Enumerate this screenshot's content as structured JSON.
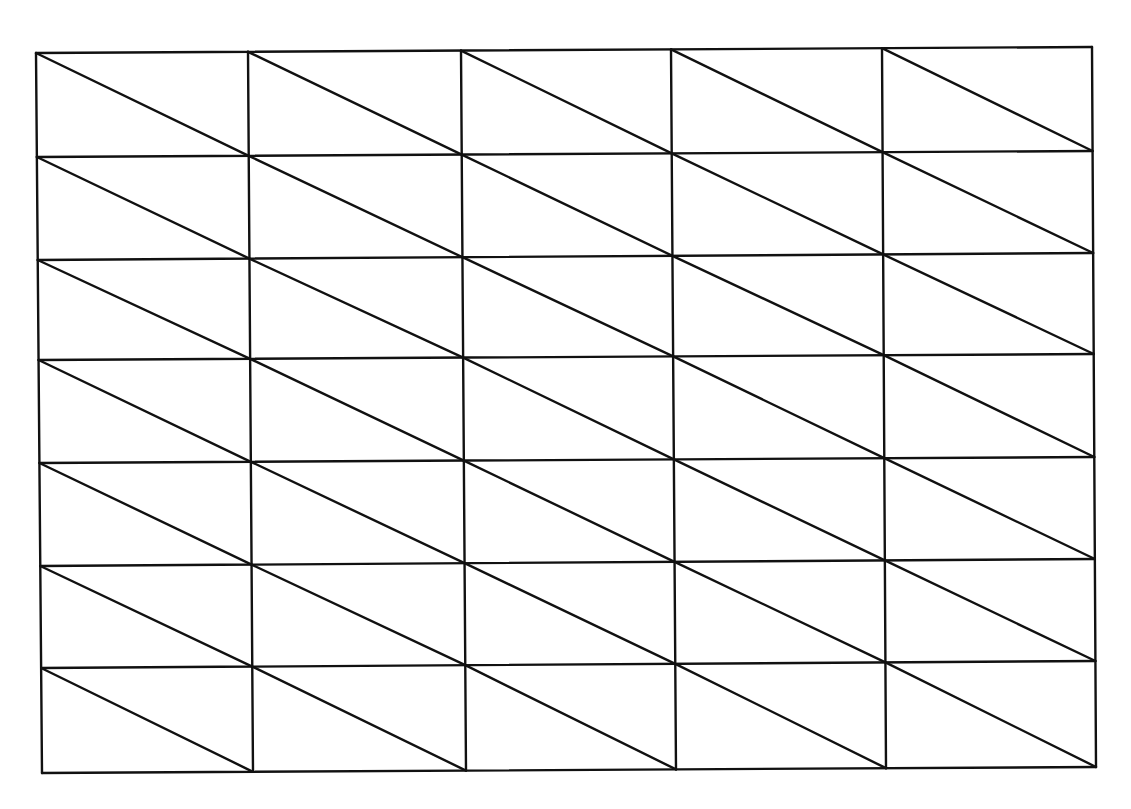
{
  "diagram": {
    "type": "triangulated-rectangular-mesh",
    "columns": 5,
    "rows": 7,
    "diagonal": "top-left to bottom-right in every cell",
    "line_color": "#111111",
    "background": "#ffffff",
    "x_lines_top": [
      36,
      248,
      461,
      671,
      882,
      1092
    ],
    "x_lines_bottom": [
      42,
      253,
      466,
      676,
      886,
      1096
    ],
    "y_lines_left": [
      53,
      157,
      260,
      360,
      463,
      566,
      668,
      773
    ],
    "y_lines_right": [
      47,
      151,
      253,
      354,
      457,
      559,
      661,
      767
    ]
  }
}
